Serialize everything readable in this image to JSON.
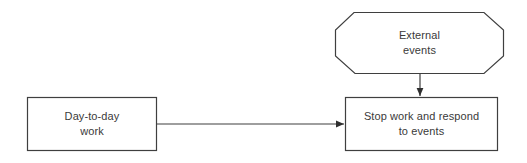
{
  "diagram": {
    "type": "flowchart",
    "background_color": "#ffffff",
    "stroke_color": "#3f3f3f",
    "text_color": "#3a3a3a",
    "nodes": [
      {
        "id": "daily_work",
        "shape": "rectangle",
        "lines": [
          "Day-to-day",
          "work"
        ],
        "x": 27,
        "y": 97,
        "width": 130,
        "height": 54
      },
      {
        "id": "external_events",
        "shape": "octagon",
        "lines": [
          "External",
          "events"
        ],
        "x": 335,
        "y": 12,
        "width": 169,
        "height": 62
      },
      {
        "id": "stop_work",
        "shape": "rectangle",
        "lines": [
          "Stop work and respond",
          "to events"
        ],
        "x": 345,
        "y": 97,
        "width": 153,
        "height": 54
      }
    ],
    "edges": [
      {
        "id": "daily_to_stop",
        "from": "daily_work",
        "to": "stop_work",
        "direction": "right",
        "label": ""
      },
      {
        "id": "external_to_stop",
        "from": "external_events",
        "to": "stop_work",
        "direction": "down",
        "label": ""
      }
    ]
  }
}
